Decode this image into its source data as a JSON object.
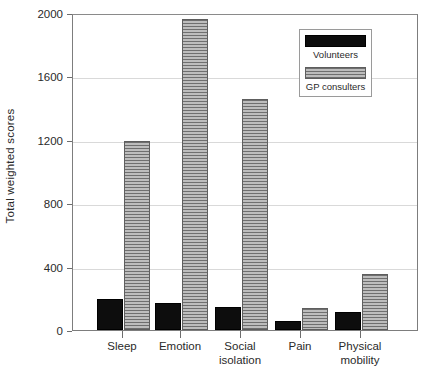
{
  "chart_data": {
    "type": "bar",
    "title": "",
    "xlabel": "",
    "ylabel": "Total weighted scores",
    "ylim": [
      0,
      2000
    ],
    "yticks": [
      0,
      400,
      800,
      1200,
      1600,
      2000
    ],
    "ytick_labels": [
      "0",
      "400",
      "800",
      "1200",
      "1600",
      "2000"
    ],
    "grid": true,
    "legend_position": "top-right",
    "categories": [
      "Sleep",
      "Emotion",
      "Social isolation",
      "Pain",
      "Physical mobility"
    ],
    "category_labels": [
      [
        "Sleep"
      ],
      [
        "Emotion"
      ],
      [
        "Social",
        "isolation"
      ],
      [
        "Pain"
      ],
      [
        "Physical",
        "mobility"
      ]
    ],
    "series": [
      {
        "name": "Volunteers",
        "color": "#0d0d0d",
        "fill": "solid-black",
        "values": [
          195,
          170,
          145,
          55,
          115
        ]
      },
      {
        "name": "GP consulters",
        "color": "#9a9a9a",
        "fill": "gray-horizontal-hatch",
        "values": [
          1195,
          1960,
          1455,
          140,
          355
        ]
      }
    ]
  },
  "legend": {
    "entries": [
      {
        "label": "Volunteers",
        "swatch": "volunteers"
      },
      {
        "label": "GP consulters",
        "swatch": "gp"
      }
    ]
  },
  "colors": {
    "volunteers": "#0d0d0d",
    "gp_consulters": "#9a9a9a",
    "gridline": "#d9d9d9",
    "axis": "#7d7d7d",
    "text": "#2a2a2a"
  }
}
